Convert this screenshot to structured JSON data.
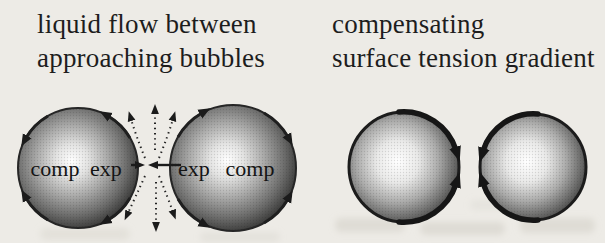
{
  "colors": {
    "background": "#edebe6",
    "ink": "#1c1c1c",
    "bubble_rim": "#262626",
    "bubble_core": "#ffffff"
  },
  "panels": {
    "left": {
      "title": [
        "liquid flow between",
        "approaching bubbles"
      ],
      "bubbles": {
        "left": {
          "label_back": "comp",
          "label_front": "exp"
        },
        "right": {
          "label_front": "exp",
          "label_back": "comp"
        }
      }
    },
    "right": {
      "title": [
        "compensating",
        "surface tension gradient"
      ]
    }
  }
}
